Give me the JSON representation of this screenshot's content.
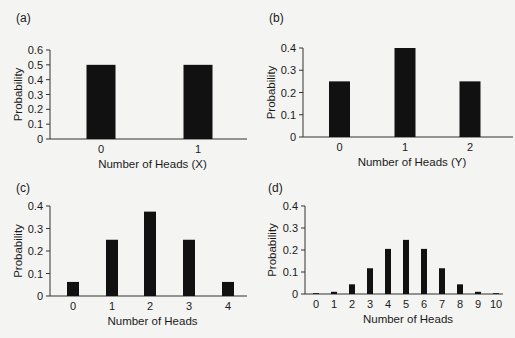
{
  "figure": {
    "background": "#f4f4f2",
    "bar_color": "#111111",
    "axis_color": "#333333"
  },
  "chart_data": [
    {
      "panel": "(a)",
      "type": "bar",
      "title": "",
      "categories": [
        "0",
        "1"
      ],
      "values": [
        0.5,
        0.5
      ],
      "xlabel": "Number of Heads (X)",
      "ylabel": "Probability",
      "ylim": [
        0,
        0.6
      ],
      "yticks": [
        "0",
        "0.1",
        "0.2",
        "0.3",
        "0.4",
        "0.5",
        "0.6"
      ],
      "grid": false,
      "legend": null,
      "layout": {
        "x0": 50,
        "x1": 247,
        "ytop": 50,
        "ybot": 139,
        "centers": [
          101,
          198
        ],
        "bar_width": 29,
        "panel_label_x": 16,
        "panel_label_y": 22,
        "ylabel_x": 22
      }
    },
    {
      "panel": "(b)",
      "type": "bar",
      "title": "",
      "categories": [
        "0",
        "1",
        "2"
      ],
      "values": [
        0.25,
        0.4,
        0.25
      ],
      "xlabel": "Number of Heads (Y)",
      "ylabel": "Probability",
      "ylim": [
        0,
        0.4
      ],
      "yticks": [
        "0",
        "0.1",
        "0.2",
        "0.3",
        "0.4"
      ],
      "grid": false,
      "legend": null,
      "layout": {
        "x0": 303,
        "x1": 513,
        "ytop": 48,
        "ybot": 137,
        "centers": [
          339.5,
          405,
          470
        ],
        "bar_width": 21,
        "panel_label_x": 269,
        "panel_label_y": 22,
        "ylabel_x": 275
      }
    },
    {
      "panel": "(c)",
      "type": "bar",
      "title": "",
      "categories": [
        "0",
        "1",
        "2",
        "3",
        "4"
      ],
      "values": [
        0.0625,
        0.25,
        0.375,
        0.25,
        0.0625
      ],
      "xlabel": "Number of Heads",
      "ylabel": "Probability",
      "ylim": [
        0,
        0.4
      ],
      "yticks": [
        "0",
        "0.1",
        "0.2",
        "0.3",
        "0.4"
      ],
      "grid": false,
      "legend": null,
      "layout": {
        "x0": 50,
        "x1": 247,
        "ytop": 206,
        "ybot": 296,
        "centers": [
          73,
          112,
          150,
          189,
          228
        ],
        "bar_width": 12,
        "panel_label_x": 16,
        "panel_label_y": 192,
        "ylabel_x": 22
      }
    },
    {
      "panel": "(d)",
      "type": "bar",
      "title": "",
      "categories": [
        "0",
        "1",
        "2",
        "3",
        "4",
        "5",
        "6",
        "7",
        "8",
        "9",
        "10"
      ],
      "values": [
        0.001,
        0.01,
        0.044,
        0.117,
        0.205,
        0.246,
        0.205,
        0.117,
        0.044,
        0.01,
        0.001
      ],
      "xlabel": "Number of Heads",
      "ylabel": "Probability",
      "ylim": [
        0,
        0.4
      ],
      "yticks": [
        "0",
        "0.1",
        "0.2",
        "0.3",
        "0.4"
      ],
      "grid": false,
      "legend": null,
      "layout": {
        "x0": 305,
        "x1": 503,
        "ytop": 206,
        "ybot": 294,
        "centers": [
          316,
          334,
          352,
          370,
          388,
          406,
          424,
          442,
          460,
          478,
          496
        ],
        "bar_width": 6,
        "panel_label_x": 268,
        "panel_label_y": 192,
        "ylabel_x": 276
      }
    }
  ]
}
